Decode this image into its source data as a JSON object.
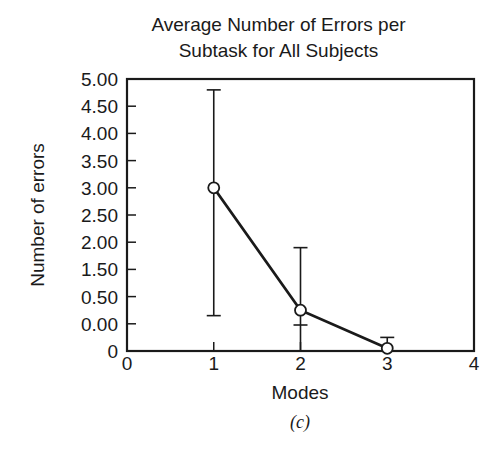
{
  "chart_data": {
    "type": "line",
    "title_lines": [
      "Average Number of Errors per",
      "Subtask for All Subjects"
    ],
    "xlabel": "Modes",
    "ylabel": "Number of errors",
    "caption": "(c)",
    "x_ticks": [
      "0",
      "1",
      "2",
      "3",
      "4"
    ],
    "y_ticks": [
      "5.00",
      "4.50",
      "4.00",
      "3.50",
      "3.00",
      "2.50",
      "2.00",
      "1.50",
      "0.50",
      "0.00",
      "0"
    ],
    "xlim": [
      0,
      4
    ],
    "ylim": [
      0,
      5.0
    ],
    "grid": false,
    "legend": null,
    "series": [
      {
        "name": "Average errors",
        "marker": "open-circle",
        "x": [
          1,
          2,
          3
        ],
        "values": [
          3.0,
          0.75,
          0.05
        ],
        "error_low": [
          0.65,
          0.0,
          0.0
        ],
        "error_high": [
          4.8,
          1.9,
          0.25
        ]
      }
    ]
  }
}
